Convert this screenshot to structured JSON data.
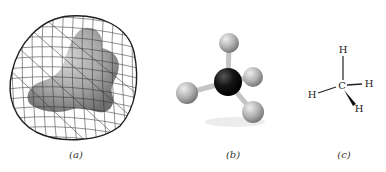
{
  "figure": {
    "panels": [
      {
        "id": "a",
        "caption": "(a)",
        "depiction": "space-filling model inside electron-density mesh surface"
      },
      {
        "id": "b",
        "caption": "(b)",
        "depiction": "ball-and-stick model"
      },
      {
        "id": "c",
        "caption": "(c)",
        "depiction": "wedge-dash structural formula"
      }
    ],
    "structural_formula": {
      "central": "C",
      "top": "H",
      "left": "H",
      "right": "H",
      "bottom": "H"
    }
  },
  "colors": {
    "mesh": "#2a2a2a",
    "surface": "#9a9a9a",
    "hydrogen_ball": "#b5b5b5",
    "carbon_ball": "#111111",
    "bond": "#c8c8c8",
    "text": "#222222"
  }
}
